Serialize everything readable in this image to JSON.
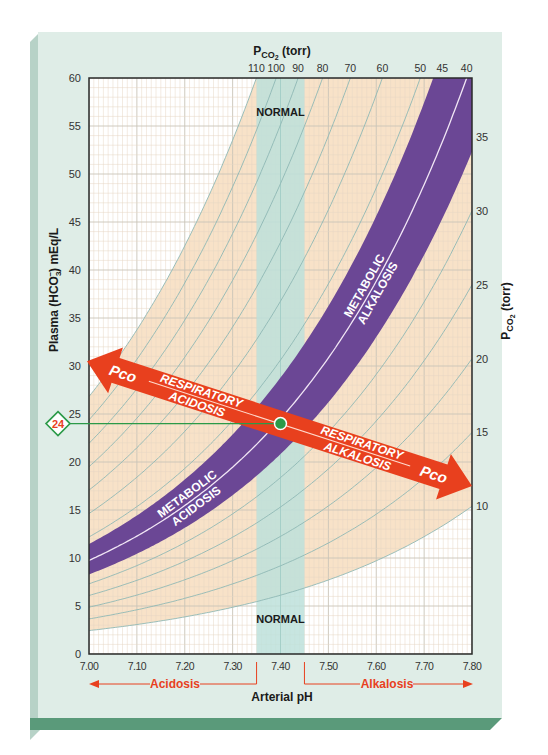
{
  "chart_data": {
    "type": "line",
    "xlabel": "Arterial pH",
    "ylabel": "Plasma (HCO3-) mEq/L",
    "ylabel_parts": {
      "prefix": "Plasma (HCO",
      "sub": "3",
      "sup": "−",
      "suffix": ") mEq/L"
    },
    "top_axis_label": "PCO2 (torr)",
    "right_axis_label": "PCO2 (torr)",
    "pco2_label_parts": {
      "p": "P",
      "sub": "CO",
      "sub2": "2",
      "suffix": " (torr)"
    },
    "xlim": [
      7.0,
      7.8
    ],
    "ylim": [
      0,
      60
    ],
    "x_ticks": [
      "7.00",
      "7.10",
      "7.20",
      "7.30",
      "7.40",
      "7.50",
      "7.60",
      "7.70",
      "7.80"
    ],
    "y_ticks": [
      "0",
      "5",
      "10",
      "15",
      "20",
      "25",
      "30",
      "35",
      "40",
      "45",
      "50",
      "55",
      "60"
    ],
    "top_pco2_ticks": [
      "110",
      "100",
      "90",
      "80",
      "70",
      "60",
      "50",
      "45",
      "40"
    ],
    "right_pco2_ticks": [
      "35",
      "30",
      "25",
      "20",
      "15",
      "10"
    ],
    "isopleths_pco2": [
      10,
      15,
      20,
      25,
      30,
      35,
      40,
      45,
      50,
      60,
      70,
      80,
      90,
      100,
      110
    ],
    "normal_band": {
      "ph_min": 7.35,
      "ph_max": 7.45,
      "label_top": "NORMAL",
      "label_bottom": "NORMAL"
    },
    "normal_point": {
      "ph": 7.4,
      "hco3": 24,
      "pco2": 40,
      "marker_label": "24"
    },
    "metabolic_band": {
      "center_pco2": 40,
      "pco2_range": [
        34,
        47
      ],
      "upper_label": [
        "METABOLIC",
        "ALKALOSIS"
      ],
      "lower_label": [
        "METABOLIC",
        "ACIDOSIS"
      ]
    },
    "respiratory_arrow": {
      "left_end": {
        "ph": 7.0,
        "hco3": 30.5
      },
      "right_end": {
        "ph": 7.8,
        "hco3": 17.5
      },
      "left_label": [
        "RESPIRATORY",
        "ACIDOSIS"
      ],
      "right_label": [
        "RESPIRATORY",
        "ALKALOSIS"
      ],
      "end_tag": "Pco2"
    },
    "shaded_region": {
      "pco2_min": 10,
      "pco2_max": 110,
      "color": "#f8e2c8"
    },
    "bottom_annotations": {
      "acidosis": "Acidosis",
      "alkalosis": "Alkalosis"
    },
    "grid": true
  },
  "colors": {
    "card_bg": "#dfede7",
    "card_edge": "#b7d2c7",
    "card_base": "#5a9a7a",
    "peach": "#f8e2c8",
    "grid_minor": "#e6d6c4",
    "grid_major": "#c9c4b8",
    "isopleth": "#8fb8b4",
    "purple": "#6b4795",
    "red": "#e8401e",
    "green": "#2b9a48",
    "normal_band": "#bde0da"
  }
}
